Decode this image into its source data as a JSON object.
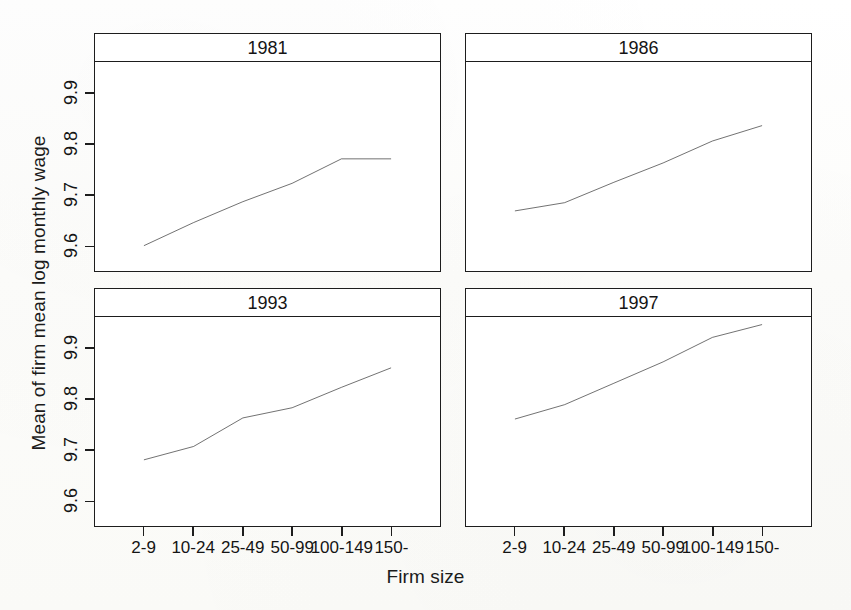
{
  "chart_data": {
    "type": "line",
    "title": "",
    "xlabel": "Firm size",
    "ylabel": "Mean of firm mean log monthly wage",
    "categories": [
      "2-9",
      "10-24",
      "25-49",
      "50-99",
      "100-149",
      "150-"
    ],
    "ylim": [
      9.55,
      9.96
    ],
    "yticks": [
      9.6,
      9.7,
      9.8,
      9.9
    ],
    "ytick_labels": [
      "9.6",
      "9.7",
      "9.8",
      "9.9"
    ],
    "grid": false,
    "legend": "none",
    "layout": "2x2 trellis panels, shared axes",
    "line_color": "#1a1a1a",
    "panels": [
      {
        "label": "1981",
        "row": 0,
        "col": 0,
        "series": [
          {
            "name": "1981",
            "values": [
              9.6,
              9.645,
              9.686,
              9.722,
              9.77,
              9.77
            ]
          }
        ]
      },
      {
        "label": "1986",
        "row": 0,
        "col": 1,
        "series": [
          {
            "name": "1986",
            "values": [
              9.668,
              9.684,
              9.724,
              9.762,
              9.805,
              9.835
            ]
          }
        ]
      },
      {
        "label": "1993",
        "row": 1,
        "col": 0,
        "series": [
          {
            "name": "1993",
            "values": [
              9.68,
              9.706,
              9.762,
              9.782,
              9.822,
              9.86
            ]
          }
        ]
      },
      {
        "label": "1997",
        "row": 1,
        "col": 1,
        "series": [
          {
            "name": "1997",
            "values": [
              9.76,
              9.788,
              9.83,
              9.872,
              9.92,
              9.945
            ]
          }
        ]
      }
    ]
  },
  "figure": {
    "xlabel": "Firm size",
    "ylabel": "Mean of firm mean log monthly wage",
    "background": "#fdfdfb",
    "foreground": "#1a1a1a"
  }
}
